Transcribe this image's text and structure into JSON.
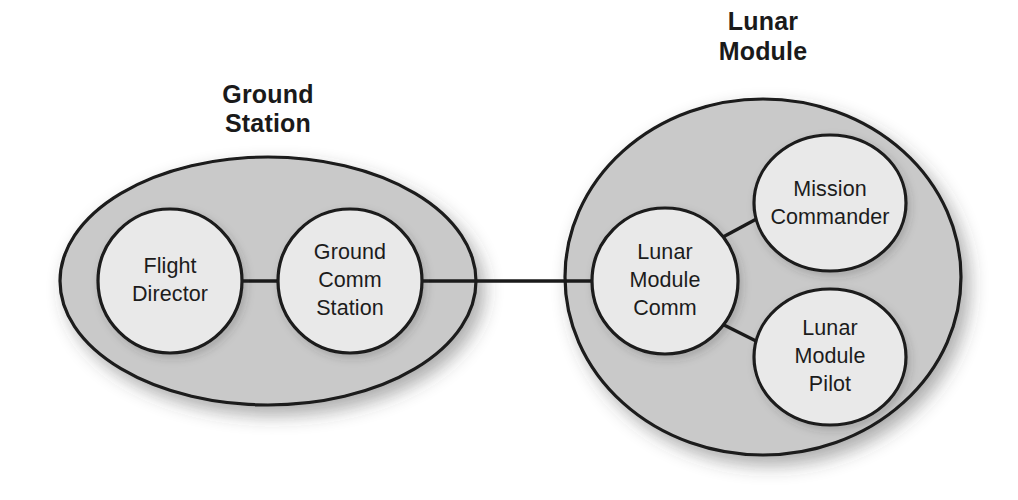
{
  "diagram": {
    "title_visible": false,
    "background_color": "#ffffff",
    "group_fill": "#c9c9c9",
    "node_fill": "#e9e9e9",
    "stroke_color": "#1a1a1a",
    "groups": [
      {
        "id": "ground-station",
        "title_line1": "Ground",
        "title_line2": "Station",
        "title_center_x": 268,
        "title_y1": 103,
        "title_y2": 132,
        "shape": "ellipse",
        "cx": 268,
        "cy": 281,
        "rx": 208,
        "ry": 124
      },
      {
        "id": "lunar-module",
        "title_line1": "Lunar",
        "title_line2": "Module",
        "title_center_x": 763,
        "title_y1": 30,
        "title_y2": 60,
        "shape": "ellipse",
        "cx": 763,
        "cy": 277,
        "rx": 198,
        "ry": 178
      }
    ],
    "nodes": [
      {
        "id": "flight-director",
        "group": "ground-station",
        "lines": [
          "Flight",
          "Director"
        ],
        "cx": 170,
        "cy": 281,
        "rx": 72,
        "ry": 72
      },
      {
        "id": "ground-comm-station",
        "group": "ground-station",
        "lines": [
          "Ground",
          "Comm",
          "Station"
        ],
        "cx": 350,
        "cy": 281,
        "rx": 72,
        "ry": 72
      },
      {
        "id": "lunar-module-comm",
        "group": "lunar-module",
        "lines": [
          "Lunar",
          "Module",
          "Comm"
        ],
        "cx": 665,
        "cy": 281,
        "rx": 73,
        "ry": 73
      },
      {
        "id": "mission-commander",
        "group": "lunar-module",
        "lines": [
          "Mission",
          "Commander"
        ],
        "cx": 830,
        "cy": 203,
        "rx": 76,
        "ry": 68
      },
      {
        "id": "lunar-module-pilot",
        "group": "lunar-module",
        "lines": [
          "Lunar",
          "Module",
          "Pilot"
        ],
        "cx": 830,
        "cy": 357,
        "rx": 76,
        "ry": 68
      }
    ],
    "edges": [
      {
        "id": "edge-flight-director-ground-comm",
        "from": "flight-director",
        "to": "ground-comm-station",
        "x1": 242,
        "y1": 281,
        "x2": 278,
        "y2": 281
      },
      {
        "id": "edge-ground-comm-lunar-comm",
        "from": "ground-comm-station",
        "to": "lunar-module-comm",
        "x1": 422,
        "y1": 281,
        "x2": 592,
        "y2": 281
      },
      {
        "id": "edge-lunar-comm-mission-commander",
        "from": "lunar-module-comm",
        "to": "mission-commander",
        "x1": 723,
        "y1": 237,
        "x2": 762,
        "y2": 216
      },
      {
        "id": "edge-lunar-comm-lunar-pilot",
        "from": "lunar-module-comm",
        "to": "lunar-module-pilot",
        "x1": 722,
        "y1": 324,
        "x2": 762,
        "y2": 344
      }
    ]
  }
}
